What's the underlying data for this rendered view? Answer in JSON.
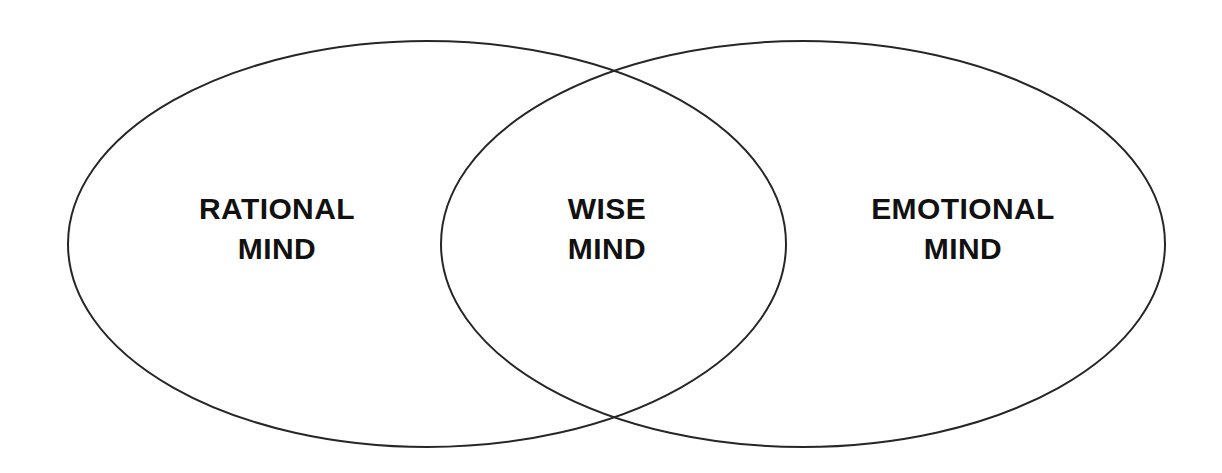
{
  "canvas": {
    "width": 1222,
    "height": 473,
    "background_color": "#ffffff"
  },
  "diagram": {
    "type": "venn-diagram",
    "set_count": 2,
    "stroke_color": "#262626",
    "stroke_width": 2,
    "text_color": "#111111",
    "ellipses": [
      {
        "id": "rational-ellipse",
        "name": "rational-mind-ellipse",
        "cx": 427,
        "cy": 244,
        "rx": 359,
        "ry": 203
      },
      {
        "id": "emotional-ellipse",
        "name": "emotional-mind-ellipse",
        "cx": 803,
        "cy": 244,
        "rx": 362,
        "ry": 203
      }
    ],
    "intersections": [
      {
        "x": 612,
        "y": 72
      },
      {
        "x": 611,
        "y": 422
      }
    ],
    "regions": [
      {
        "id": "rational-mind",
        "position": "left",
        "line1": "RATIONAL",
        "line2": "MIND",
        "center_x": 277,
        "center_y": 229
      },
      {
        "id": "wise-mind",
        "position": "center-overlap",
        "line1": "WISE",
        "line2": "MIND",
        "center_x": 607,
        "center_y": 229
      },
      {
        "id": "emotional-mind",
        "position": "right",
        "line1": "EMOTIONAL",
        "line2": "MIND",
        "center_x": 963,
        "center_y": 229
      }
    ]
  }
}
